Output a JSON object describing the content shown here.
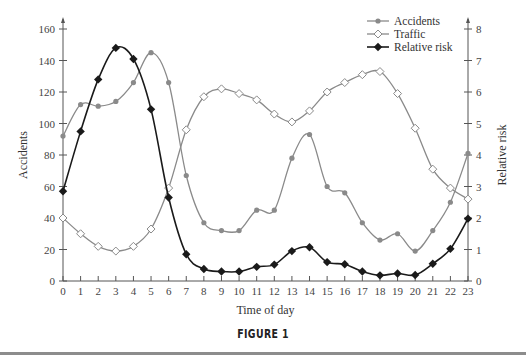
{
  "chart_data": {
    "type": "line",
    "title": "",
    "caption": "FIGURE 1",
    "xlabel": "Time of day",
    "ylabel": "Accidents",
    "y2label": "Relative risk",
    "x": [
      0,
      1,
      2,
      3,
      4,
      5,
      6,
      7,
      8,
      9,
      10,
      11,
      12,
      13,
      14,
      15,
      16,
      17,
      18,
      19,
      20,
      21,
      22,
      23
    ],
    "xlim": [
      0,
      23
    ],
    "ylim": [
      0,
      160
    ],
    "y2lim": [
      0,
      8
    ],
    "yticks": [
      0,
      20,
      40,
      60,
      80,
      100,
      120,
      140,
      160
    ],
    "y2ticks": [
      0,
      1,
      2,
      3,
      4,
      5,
      6,
      7,
      8
    ],
    "grid": false,
    "legend_position": "upper right",
    "series": [
      {
        "name": "Accidents",
        "axis": "left",
        "marker": "filled-circle",
        "color": "#8a8a8a",
        "values": [
          92,
          112,
          111,
          114,
          126,
          145,
          126,
          67,
          37,
          32,
          32,
          45,
          45,
          78,
          93,
          60,
          56,
          37,
          26,
          30,
          19,
          32,
          50,
          81
        ]
      },
      {
        "name": "Traffic",
        "axis": "left",
        "marker": "open-diamond",
        "color": "#8a8a8a",
        "values": [
          40,
          30,
          22,
          19,
          22,
          33,
          59,
          96,
          117,
          122,
          119,
          115,
          106,
          101,
          108,
          120,
          126,
          131,
          133,
          119,
          97,
          71,
          59,
          52
        ]
      },
      {
        "name": "Relative risk",
        "axis": "right",
        "marker": "filled-diamond",
        "color": "#1a1a1a",
        "values": [
          2.85,
          4.75,
          6.4,
          7.4,
          7.05,
          5.45,
          2.65,
          0.85,
          0.38,
          0.3,
          0.3,
          0.45,
          0.52,
          0.95,
          1.07,
          0.6,
          0.53,
          0.3,
          0.18,
          0.24,
          0.19,
          0.55,
          1.02,
          1.98
        ]
      }
    ]
  },
  "labels": {
    "xlabel": "Time of day",
    "ylabel": "Accidents",
    "y2label": "Relative risk",
    "caption": "FIGURE 1",
    "legend": [
      "Accidents",
      "Traffic",
      "Relative risk"
    ]
  }
}
